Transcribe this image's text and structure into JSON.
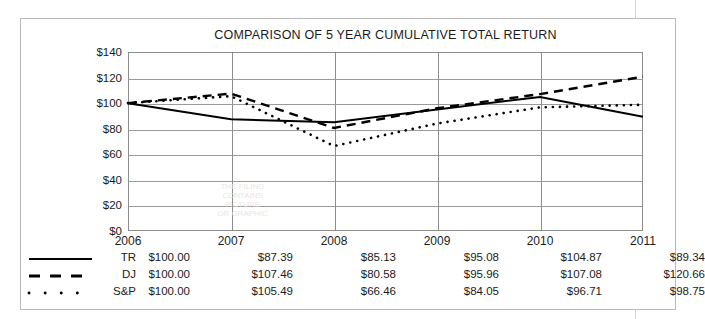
{
  "chart_data": {
    "type": "line",
    "title": "COMPARISON OF 5 YEAR CUMULATIVE TOTAL RETURN",
    "xlabel": "",
    "ylabel": "",
    "categories": [
      "2006",
      "2007",
      "2008",
      "2009",
      "2010",
      "2011"
    ],
    "ylim": [
      0,
      140
    ],
    "ytick_values": [
      0,
      20,
      40,
      60,
      80,
      100,
      120,
      140
    ],
    "ytick_labels": [
      "$0",
      "$20",
      "$40",
      "$60",
      "$80",
      "$100",
      "$120",
      "$140"
    ],
    "grid": true,
    "legend_position": "bottom-table",
    "series": [
      {
        "name": "TR",
        "style": "solid",
        "values": [
          100.0,
          87.39,
          85.13,
          95.08,
          104.87,
          89.34
        ],
        "labels": [
          "$100.00",
          "$87.39",
          "$85.13",
          "$95.08",
          "$104.87",
          "$89.34"
        ]
      },
      {
        "name": "DJ",
        "style": "dashed",
        "values": [
          100.0,
          107.46,
          80.58,
          95.96,
          107.08,
          120.66
        ],
        "labels": [
          "$100.00",
          "$107.46",
          "$80.58",
          "$95.96",
          "$107.08",
          "$120.66"
        ]
      },
      {
        "name": "S&P",
        "style": "dotted",
        "values": [
          100.0,
          105.49,
          66.46,
          84.05,
          96.71,
          98.75
        ],
        "labels": [
          "$100.00",
          "$105.49",
          "$66.46",
          "$84.05",
          "$96.71",
          "$98.75"
        ]
      }
    ]
  },
  "colors": {
    "line": "#000000",
    "grid": "#9a9a9a",
    "axis": "#8c8c8c",
    "frame": "#b9b9b9",
    "text": "#1b1b1b"
  },
  "watermark": {
    "line1": "THE FILING",
    "line2": "CONTAINS",
    "line3": "PICTURE",
    "line4": "OR GRAPHIC"
  }
}
